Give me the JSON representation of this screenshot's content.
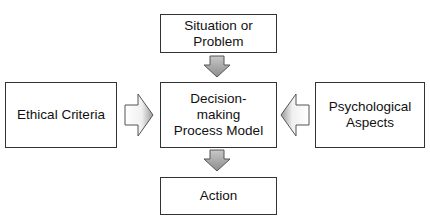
{
  "diagram": {
    "nodes": {
      "top": {
        "lines": [
          "Situation or",
          "Problem"
        ]
      },
      "center": {
        "lines": [
          "Decision-",
          "making",
          "Process Model"
        ]
      },
      "left": {
        "lines": [
          "Ethical Criteria"
        ]
      },
      "right": {
        "lines": [
          "Psychological",
          "Aspects"
        ]
      },
      "bottom": {
        "lines": [
          "Action"
        ]
      }
    },
    "edges": [
      {
        "from": "top",
        "to": "center",
        "style": "block-arrow-down"
      },
      {
        "from": "left",
        "to": "center",
        "style": "block-arrow-right"
      },
      {
        "from": "right",
        "to": "center",
        "style": "block-arrow-left"
      },
      {
        "from": "center",
        "to": "bottom",
        "style": "block-arrow-down"
      }
    ],
    "colors": {
      "border": "#333333",
      "arrow_fill_dark": "#8c8c8c",
      "arrow_fill_light": "#f2f2f2"
    }
  }
}
